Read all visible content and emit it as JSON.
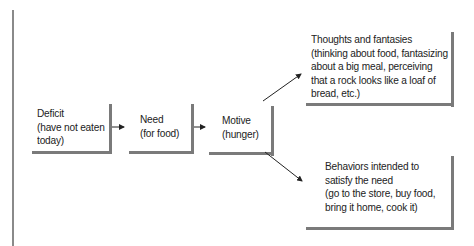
{
  "diagram": {
    "nodes": [
      {
        "id": "deficit",
        "title": "Deficit",
        "lines": [
          "Deficit",
          "(have not eaten",
          "today)"
        ]
      },
      {
        "id": "need",
        "title": "Need",
        "lines": [
          "Need",
          "(for food)"
        ]
      },
      {
        "id": "motive",
        "title": "Motive",
        "lines": [
          "Motive",
          "(hunger)"
        ]
      },
      {
        "id": "thoughts",
        "title": "Thoughts and fantasies",
        "lines": [
          "Thoughts and fantasies",
          "(thinking about food, fantasizing",
          "about a big meal, perceiving",
          "that a rock looks like a loaf of",
          "bread, etc.)"
        ]
      },
      {
        "id": "behaviors",
        "title": "Behaviors intended to satisfy the need",
        "lines": [
          "Behaviors intended to",
          "satisfy the need",
          "(go to the store, buy food,",
          "bring it home, cook it)"
        ]
      }
    ],
    "edges": [
      {
        "from": "deficit",
        "to": "need"
      },
      {
        "from": "need",
        "to": "motive"
      },
      {
        "from": "motive",
        "to": "thoughts"
      },
      {
        "from": "motive",
        "to": "behaviors"
      }
    ],
    "colors": {
      "shadow": "#7a7a7a",
      "text": "#222222",
      "rule": "#8a8a8a",
      "arrow": "#222222"
    }
  }
}
